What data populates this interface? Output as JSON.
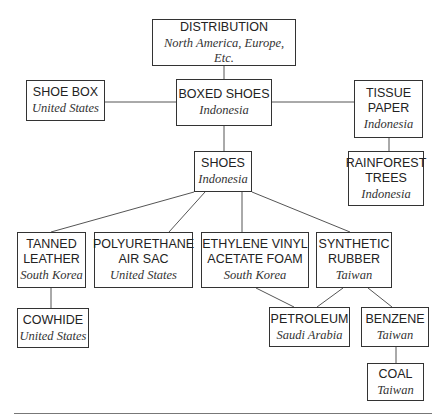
{
  "diagram": {
    "nodes": {
      "distribution": {
        "name": "DISTRIBUTION",
        "origin": "North America, Europe, Etc."
      },
      "boxed_shoes": {
        "name": "BOXED SHOES",
        "origin": "Indonesia"
      },
      "shoe_box": {
        "name": "SHOE BOX",
        "origin": "United States"
      },
      "tissue_paper": {
        "name": "TISSUE\nPAPER",
        "origin": "Indonesia"
      },
      "rainforest_trees": {
        "name": "RAINFOREST\nTREES",
        "origin": "Indonesia"
      },
      "shoes": {
        "name": "SHOES",
        "origin": "Indonesia"
      },
      "tanned_leather": {
        "name": "TANNED\nLEATHER",
        "origin": "South Korea"
      },
      "polyurethane_air_sac": {
        "name": "POLYURETHANE\nAIR SAC",
        "origin": "United States"
      },
      "eva_foam": {
        "name": "ETHYLENE VINYL\nACETATE FOAM",
        "origin": "South Korea"
      },
      "synthetic_rubber": {
        "name": "SYNTHETIC\nRUBBER",
        "origin": "Taiwan"
      },
      "cowhide": {
        "name": "COWHIDE",
        "origin": "United States"
      },
      "petroleum": {
        "name": "PETROLEUM",
        "origin": "Saudi Arabia"
      },
      "benzene": {
        "name": "BENZENE",
        "origin": "Taiwan"
      },
      "coal": {
        "name": "COAL",
        "origin": "Taiwan"
      }
    },
    "edges": [
      [
        "distribution",
        "boxed_shoes"
      ],
      [
        "shoe_box",
        "boxed_shoes"
      ],
      [
        "boxed_shoes",
        "tissue_paper"
      ],
      [
        "tissue_paper",
        "rainforest_trees"
      ],
      [
        "boxed_shoes",
        "shoes"
      ],
      [
        "shoes",
        "tanned_leather"
      ],
      [
        "shoes",
        "polyurethane_air_sac"
      ],
      [
        "shoes",
        "eva_foam"
      ],
      [
        "shoes",
        "synthetic_rubber"
      ],
      [
        "tanned_leather",
        "cowhide"
      ],
      [
        "eva_foam",
        "petroleum"
      ],
      [
        "synthetic_rubber",
        "petroleum"
      ],
      [
        "synthetic_rubber",
        "benzene"
      ],
      [
        "benzene",
        "coal"
      ]
    ]
  }
}
